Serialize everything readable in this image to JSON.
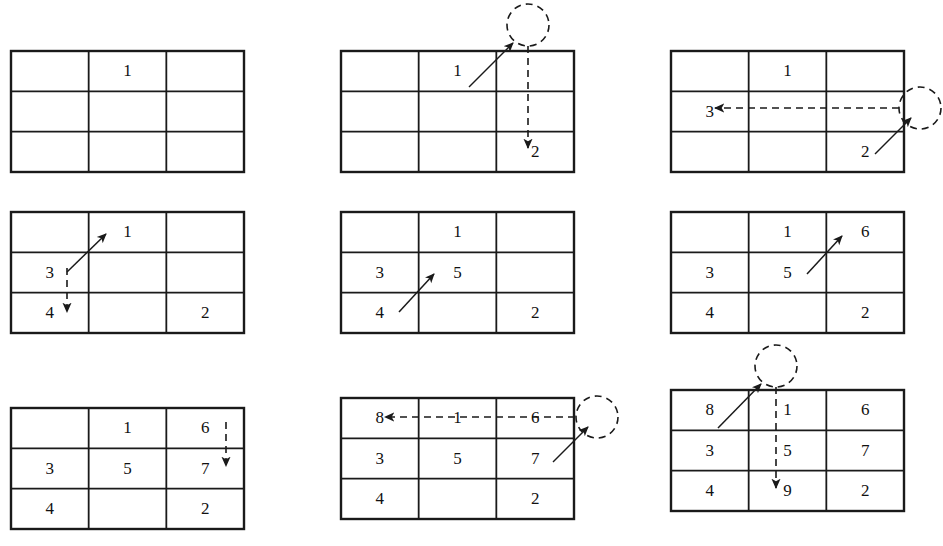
{
  "figure": {
    "rows": 3,
    "cols": 3,
    "panel_count": 9,
    "stroke_color": "#1a1a1a",
    "background_color": "#ffffff"
  },
  "geometry": {
    "grid_width": 233,
    "grid_height": 121,
    "col_width": 77.67,
    "row_height": 40.33,
    "border_width": 2.4,
    "inner_width": 1.8,
    "panel_origins": [
      {
        "x": 11,
        "y": 51
      },
      {
        "x": 341,
        "y": 51
      },
      {
        "x": 671,
        "y": 51
      },
      {
        "x": 11,
        "y": 212
      },
      {
        "x": 341,
        "y": 212
      },
      {
        "x": 671,
        "y": 212
      },
      {
        "x": 11,
        "y": 408
      },
      {
        "x": 341,
        "y": 398
      },
      {
        "x": 671,
        "y": 390
      }
    ]
  },
  "panels": [
    {
      "id": "panel-1",
      "name": "step-1-place-1",
      "cells": [
        [
          "",
          "1",
          ""
        ],
        [
          "",
          "",
          ""
        ],
        [
          "",
          "",
          ""
        ]
      ],
      "circle": null,
      "solid_arrow": null,
      "dashed_arrow": null
    },
    {
      "id": "panel-2",
      "name": "step-2-wrap-down-to-2",
      "cells": [
        [
          "",
          "1",
          ""
        ],
        [
          "",
          "",
          ""
        ],
        [
          "",
          "",
          "2"
        ]
      ],
      "circle": {
        "cx": 187,
        "cy": -26,
        "r": 21
      },
      "solid_arrow": {
        "x1": 128,
        "y1": 36,
        "x2": 172,
        "y2": -8
      },
      "dashed_arrow": {
        "x1": 187,
        "y1": -5,
        "x2": 187,
        "y2": 97
      }
    },
    {
      "id": "panel-3",
      "name": "step-3-wrap-left-to-3",
      "cells": [
        [
          "",
          "1",
          ""
        ],
        [
          "3",
          "",
          ""
        ],
        [
          "",
          "",
          "2"
        ]
      ],
      "circle": {
        "cx": 249,
        "cy": 57,
        "r": 21
      },
      "solid_arrow": {
        "x1": 204,
        "y1": 103,
        "x2": 240,
        "y2": 67
      },
      "dashed_arrow": {
        "x1": 228,
        "y1": 57,
        "x2": 44,
        "y2": 57
      }
    },
    {
      "id": "panel-4",
      "name": "step-4-blocked-move-down-to-4",
      "cells": [
        [
          "",
          "1",
          ""
        ],
        [
          "3",
          "",
          ""
        ],
        [
          "4",
          "",
          "2"
        ]
      ],
      "circle": null,
      "solid_arrow": {
        "x1": 56,
        "y1": 60,
        "x2": 95,
        "y2": 22
      },
      "dashed_arrow": {
        "x1": 56,
        "y1": 56,
        "x2": 56,
        "y2": 100
      }
    },
    {
      "id": "panel-5",
      "name": "step-5-place-5",
      "cells": [
        [
          "",
          "1",
          ""
        ],
        [
          "3",
          "5",
          ""
        ],
        [
          "4",
          "",
          "2"
        ]
      ],
      "circle": null,
      "solid_arrow": {
        "x1": 58,
        "y1": 100,
        "x2": 93,
        "y2": 62
      },
      "dashed_arrow": null
    },
    {
      "id": "panel-6",
      "name": "step-6-place-6",
      "cells": [
        [
          "",
          "1",
          "6"
        ],
        [
          "3",
          "5",
          ""
        ],
        [
          "4",
          "",
          "2"
        ]
      ],
      "circle": null,
      "solid_arrow": {
        "x1": 136,
        "y1": 62,
        "x2": 171,
        "y2": 24
      },
      "dashed_arrow": null
    },
    {
      "id": "panel-7",
      "name": "step-7-blocked-move-down-to-7",
      "cells": [
        [
          "",
          "1",
          "6"
        ],
        [
          "3",
          "5",
          "7"
        ],
        [
          "4",
          "",
          "2"
        ]
      ],
      "circle": null,
      "solid_arrow": null,
      "dashed_arrow": {
        "x1": 215,
        "y1": 14,
        "x2": 215,
        "y2": 58
      }
    },
    {
      "id": "panel-8",
      "name": "step-8-wrap-left-to-8",
      "cells": [
        [
          "8",
          "1",
          "6"
        ],
        [
          "3",
          "5",
          "7"
        ],
        [
          "4",
          "",
          "2"
        ]
      ],
      "circle": {
        "cx": 256,
        "cy": 19,
        "r": 21
      },
      "solid_arrow": {
        "x1": 212,
        "y1": 64,
        "x2": 247,
        "y2": 29
      },
      "dashed_arrow": {
        "x1": 234,
        "y1": 19,
        "x2": 44,
        "y2": 19
      }
    },
    {
      "id": "panel-9",
      "name": "step-9-wrap-down-to-9",
      "cells": [
        [
          "8",
          "1",
          "6"
        ],
        [
          "3",
          "5",
          "7"
        ],
        [
          "4",
          "9",
          "2"
        ]
      ],
      "circle": {
        "cx": 105,
        "cy": -24,
        "r": 21
      },
      "solid_arrow": {
        "x1": 47,
        "y1": 38,
        "x2": 90,
        "y2": -6
      },
      "dashed_arrow": {
        "x1": 105,
        "y1": -3,
        "x2": 105,
        "y2": 98
      }
    }
  ]
}
